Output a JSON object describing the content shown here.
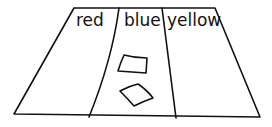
{
  "diagram": {
    "columns": [
      {
        "label": "red"
      },
      {
        "label": "blue"
      },
      {
        "label": "yellow"
      }
    ],
    "items_in_column": {
      "blue": 2,
      "red": 0,
      "yellow": 0
    }
  }
}
